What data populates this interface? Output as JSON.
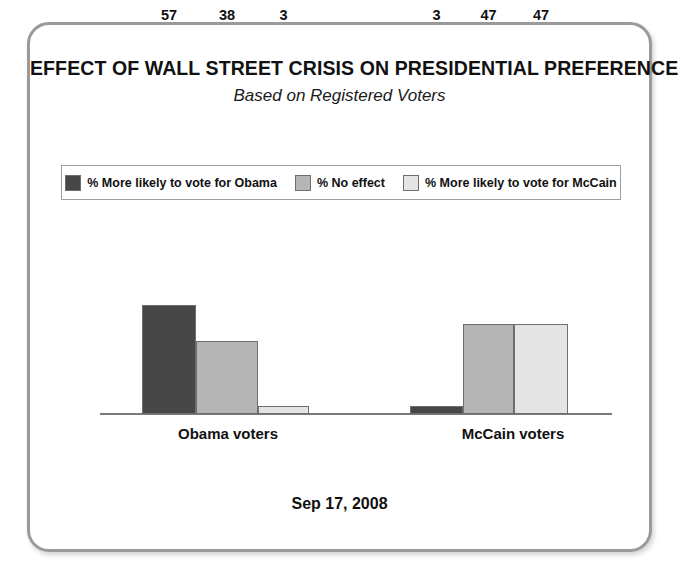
{
  "card": {
    "title": "EFFECT OF WALL STREET CRISIS ON PRESIDENTIAL PREFERENCE",
    "subtitle": "Based on Registered Voters",
    "footer_date": "Sep 17, 2008"
  },
  "legend": {
    "entries": [
      {
        "label": "% More likely to vote for Obama",
        "color": "#474747",
        "swatch_name": "legend-swatch-obama"
      },
      {
        "label": "% No effect",
        "color": "#b5b5b5",
        "swatch_name": "legend-swatch-no-effect"
      },
      {
        "label": "% More likely to vote for McCain",
        "color": "#e4e4e4",
        "swatch_name": "legend-swatch-mccain"
      }
    ]
  },
  "chart_data": {
    "type": "bar",
    "title": "EFFECT OF WALL STREET CRISIS ON PRESIDENTIAL PREFERENCE",
    "subtitle": "Based on Registered Voters",
    "xlabel": "",
    "ylabel": "",
    "ylim": [
      0,
      60
    ],
    "grid": false,
    "legend_position": "top",
    "categories": [
      "Obama voters",
      "McCain voters"
    ],
    "series": [
      {
        "name": "% More likely to vote for Obama",
        "color": "#474747",
        "values": [
          57,
          3
        ]
      },
      {
        "name": "% No effect",
        "color": "#b5b5b5",
        "values": [
          38,
          47
        ]
      },
      {
        "name": "% More likely to vote for McCain",
        "color": "#e4e4e4",
        "values": [
          3,
          47
        ]
      }
    ],
    "annotations": [
      "Sep 17, 2008"
    ]
  }
}
